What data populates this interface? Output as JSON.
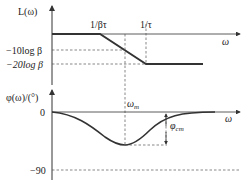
{
  "upper_plot": {
    "y_axis_label": "L(ω)",
    "x_axis_label": "ω",
    "breakpoints": [
      "1/βτ",
      "1/τ"
    ],
    "levels": [
      "−10log β",
      "−20log β"
    ]
  },
  "lower_plot": {
    "y_axis_label": "φ(ω)/(°)",
    "x_axis_label": "ω",
    "ticks": [
      "0",
      "−90"
    ],
    "annotations": {
      "omega_m": "ω",
      "omega_m_sub": "m",
      "phi_m": "φ",
      "phi_m_sub": "cm"
    }
  },
  "colors": {
    "curve": "#333333",
    "axis": "#333333",
    "dash": "#555555"
  }
}
